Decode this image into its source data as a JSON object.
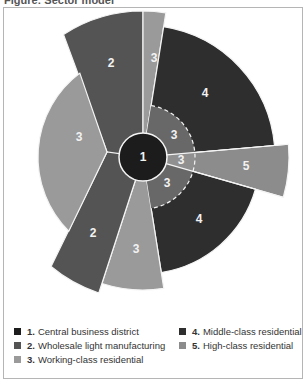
{
  "figure": {
    "title": "Figure: Sector model"
  },
  "colors": {
    "zone1": "#1c1c1c",
    "zone2": "#545454",
    "zone3": "#9a9a9a",
    "zone3_inner": "#686868",
    "zone3_inner_light": "#909090",
    "zone4": "#2e2e2e",
    "zone5": "#8c8c8c",
    "separator": "#f4f4f4"
  },
  "diagram": {
    "center": [
      143,
      157
    ],
    "core": {
      "zone": "1",
      "label": "1",
      "radius": 24
    },
    "inner_ring": {
      "radius": 52,
      "dashed": true
    },
    "sectors": [
      {
        "id": "upper-2",
        "zone": "2",
        "label": "2",
        "start": -33,
        "end": 0,
        "radius": 146,
        "label_pos": [
          111,
          63
        ]
      },
      {
        "id": "top-3",
        "zone": "3",
        "label": "3",
        "start": 0,
        "end": 9,
        "radius": 146,
        "label_pos": [
          154,
          58
        ]
      },
      {
        "id": "upper-4",
        "zone": "4",
        "label": "4",
        "start": 9,
        "end": 85,
        "radius": 132,
        "label_pos": [
          205,
          93
        ]
      },
      {
        "id": "right-5",
        "zone": "5",
        "label": "5",
        "start": 85,
        "end": 106,
        "radius": 146,
        "label_pos": [
          246,
          166
        ]
      },
      {
        "id": "lower-4",
        "zone": "4",
        "label": "4",
        "start": 106,
        "end": 171,
        "radius": 117,
        "label_pos": [
          199,
          219
        ]
      },
      {
        "id": "bottom-3",
        "zone": "3",
        "label": "3",
        "start": 171,
        "end": 198,
        "radius": 133,
        "label_pos": [
          136,
          249
        ]
      },
      {
        "id": "lower-2",
        "zone": "2",
        "label": "2",
        "start": 198,
        "end": 220,
        "radius": 143,
        "label_pos": [
          93,
          233
        ]
      },
      {
        "id": "left-3",
        "zone": "3",
        "label": "3",
        "start": 225,
        "end": 323,
        "radius": 105,
        "label_pos": [
          79,
          137
        ]
      }
    ],
    "inner_labels": [
      {
        "label": "3",
        "pos": [
          174,
          135
        ]
      },
      {
        "label": "3",
        "pos": [
          181,
          160
        ]
      },
      {
        "label": "3",
        "pos": [
          167,
          183
        ]
      }
    ]
  },
  "legend": [
    {
      "num": "1.",
      "text": "Central business district",
      "zone": "1"
    },
    {
      "num": "2.",
      "text": "Wholesale light manufacturing",
      "zone": "2"
    },
    {
      "num": "3.",
      "text": "Working-class residential",
      "zone": "3"
    },
    {
      "num": "4.",
      "text": "Middle-class residential",
      "zone": "4"
    },
    {
      "num": "5.",
      "text": "High-class residential",
      "zone": "5"
    }
  ]
}
